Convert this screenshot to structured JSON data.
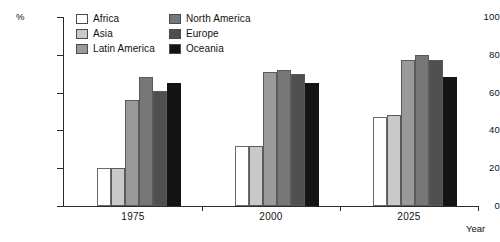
{
  "chart_data": {
    "type": "bar",
    "title": "",
    "xlabel": "Year",
    "ylabel": "%",
    "ylim": [
      0,
      100
    ],
    "yticks": [
      0,
      20,
      40,
      60,
      80,
      100
    ],
    "grid": false,
    "legend_position": "top-center",
    "categories": [
      "1975",
      "2000",
      "2025"
    ],
    "series": [
      {
        "name": "Africa",
        "color": "#ffffff",
        "values": [
          20,
          32,
          47
        ]
      },
      {
        "name": "Asia",
        "color": "#c9c9c9",
        "values": [
          20,
          32,
          48
        ]
      },
      {
        "name": "Latin America",
        "color": "#9a9a9a",
        "values": [
          56,
          71,
          77
        ]
      },
      {
        "name": "North America",
        "color": "#777777",
        "values": [
          68,
          72,
          80
        ]
      },
      {
        "name": "Europe",
        "color": "#4f4f4f",
        "values": [
          61,
          70,
          77
        ]
      },
      {
        "name": "Oceania",
        "color": "#141414",
        "values": [
          65,
          65,
          68
        ]
      }
    ]
  },
  "axes": {
    "y_unit_label": "%",
    "y_tick_labels": [
      "100",
      "80",
      "60",
      "40",
      "20",
      "0"
    ],
    "x_tick_labels": [
      "1975",
      "2000",
      "2025"
    ],
    "x_axis_title": "Year"
  },
  "legend": {
    "entries": [
      {
        "label": "Africa"
      },
      {
        "label": "Asia"
      },
      {
        "label": "Latin America"
      },
      {
        "label": "North America"
      },
      {
        "label": "Europe"
      },
      {
        "label": "Oceania"
      }
    ]
  }
}
